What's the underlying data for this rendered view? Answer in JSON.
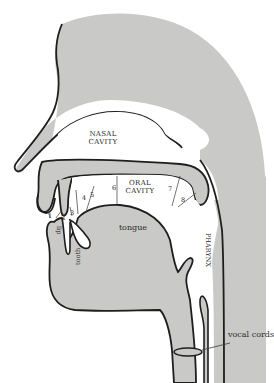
{
  "diagram": {
    "type": "anatomical cross-section",
    "colors": {
      "tissue": "#c9c9c7",
      "outline": "#1e1e1e",
      "cavity": "#ffffff",
      "text": "#2a2a2a"
    },
    "labels": {
      "nasal_cavity_line1": "NASAL",
      "nasal_cavity_line2": "CAVITY",
      "oral_cavity_line1": "ORAL",
      "oral_cavity_line2": "CAVITY",
      "tongue": "tongue",
      "lip": "lip",
      "tooth": "tooth",
      "pharynx": "PHARYNX",
      "vocal_cords": "vocal cords"
    },
    "places_of_articulation": [
      {
        "number": "1"
      },
      {
        "number": "2"
      },
      {
        "number": "3"
      },
      {
        "number": "4"
      },
      {
        "number": "5"
      },
      {
        "number": "6"
      },
      {
        "number": "7"
      },
      {
        "number": "8"
      }
    ]
  }
}
